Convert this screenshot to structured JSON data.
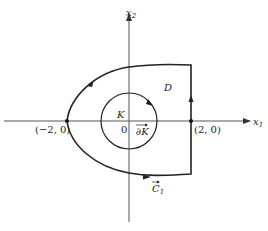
{
  "diagram": {
    "type": "region-with-hole",
    "axes": {
      "x_label": "x",
      "x_sub": "1",
      "y_label": "x",
      "y_sub": "2"
    },
    "points": [
      {
        "label": "(−2, 0)"
      },
      {
        "label": "(2, 0)"
      }
    ],
    "origin_label": "0",
    "region_label": "D",
    "disk_label": "K",
    "inner_boundary_label": "∂K",
    "outer_curve_label": "C",
    "outer_curve_sub": "1",
    "colors": {
      "stroke": "#222222",
      "axis": "#555555",
      "background": "#ffffff"
    }
  }
}
